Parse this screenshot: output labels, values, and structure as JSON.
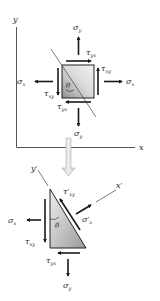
{
  "diagram": {
    "top_element": {
      "axes": {
        "x_label": "x",
        "y_label": "y"
      },
      "angle_label": "θ",
      "normal_x": {
        "symbol": "σ",
        "sub": "x"
      },
      "normal_y": {
        "symbol": "σ",
        "sub": "y"
      },
      "shear_xy": {
        "symbol": "τ",
        "sub": "xy"
      },
      "shear_yx": {
        "symbol": "τ",
        "sub": "yx"
      }
    },
    "bottom_element": {
      "axes": {
        "x_label": "x′",
        "y_label": "y′"
      },
      "angle_label": "θ",
      "normal_x": {
        "symbol": "σ",
        "sub": "x"
      },
      "normal_y": {
        "symbol": "σ",
        "sub": "y"
      },
      "shear_xy": {
        "symbol": "τ",
        "sub": "xy"
      },
      "shear_yx": {
        "symbol": "τ",
        "sub": "yx"
      },
      "normal_x_prime": {
        "symbol": "σ′",
        "sub": "x"
      },
      "shear_xy_prime": {
        "symbol": "τ′",
        "sub": "xy"
      }
    },
    "colors": {
      "arrow": "#1a1a1a",
      "axis": "#555555",
      "element_light": "#eeeeee",
      "element_dark": "#9a9a9a",
      "transition_arrow": "#d4d4d4"
    }
  }
}
